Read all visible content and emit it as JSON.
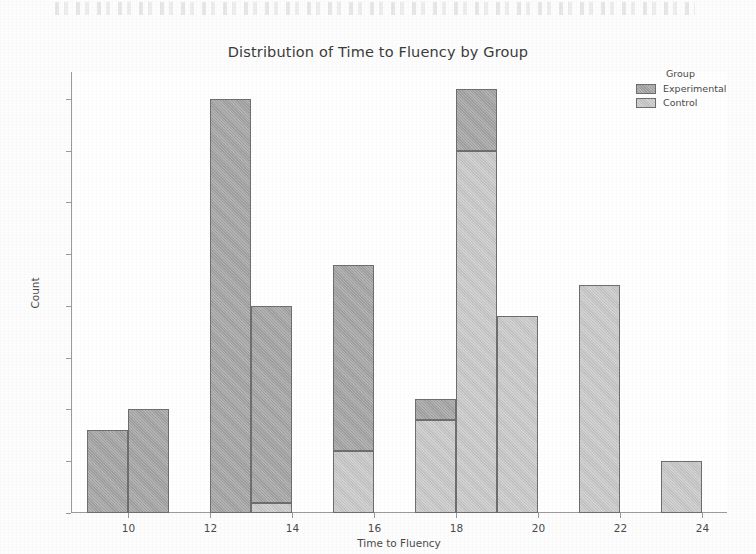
{
  "chart_data": {
    "type": "bar",
    "subtype": "stacked-histogram",
    "title": "Distribution of Time to Fluency by Group",
    "xlabel": "Time to Fluency",
    "ylabel": "Count",
    "xlim": [
      8.6,
      24.6
    ],
    "ylim": [
      0,
      42.6
    ],
    "xticks": [
      10,
      12,
      14,
      16,
      18,
      20,
      22,
      24
    ],
    "yticks": [
      0,
      5,
      10,
      15,
      20,
      25,
      30,
      35,
      40
    ],
    "grid": false,
    "bin_width": 1,
    "bin_starts": [
      9,
      10,
      11,
      12,
      13,
      14,
      15,
      16,
      17,
      18,
      19,
      20,
      21,
      22,
      23
    ],
    "categories": [
      "9-10",
      "10-11",
      "11-12",
      "12-13",
      "13-14",
      "14-15",
      "15-16",
      "16-17",
      "17-18",
      "18-19",
      "19-20",
      "20-21",
      "21-22",
      "22-23",
      "23-24"
    ],
    "series": [
      {
        "name": "Control",
        "color": "#cbcbcb",
        "values": [
          0,
          0,
          0,
          0,
          1,
          0,
          6,
          0,
          9,
          35,
          19,
          0,
          22,
          0,
          5
        ]
      },
      {
        "name": "Experimental",
        "color": "#a6a6a6",
        "values": [
          8,
          10,
          0,
          40,
          19,
          0,
          18,
          0,
          2,
          6,
          0,
          0,
          0,
          0,
          0
        ]
      }
    ],
    "totals": [
      8,
      10,
      0,
      40,
      20,
      0,
      24,
      0,
      11,
      41,
      19,
      0,
      22,
      0,
      5
    ],
    "legend": {
      "title": "Group",
      "position": "upper right outside",
      "entries": [
        {
          "label": "Experimental",
          "color": "#a6a6a6"
        },
        {
          "label": "Control",
          "color": "#cbcbcb"
        }
      ]
    }
  },
  "colors": {
    "experimental": "#a6a6a6",
    "control": "#cbcbcb",
    "edge": "#6e6e6e",
    "axis": "#9a9a9a",
    "text": "#4a4a4a",
    "title": "#3b3b3b",
    "background": "#ffffff"
  }
}
